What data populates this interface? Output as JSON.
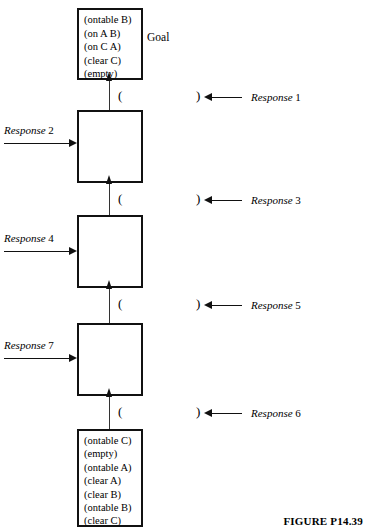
{
  "figure": {
    "caption": "FIGURE P14.39",
    "goal_annotation": "Goal",
    "paren_open": "(",
    "paren_close": ")"
  },
  "states": {
    "goal": {
      "name": "goal-state",
      "predicates": [
        "(ontable B)",
        "(on A B)",
        "(on C A)",
        "(clear C)",
        "(empty)"
      ]
    },
    "intermediate_1": {
      "name": "blank-state-1",
      "predicates": []
    },
    "intermediate_2": {
      "name": "blank-state-2",
      "predicates": []
    },
    "intermediate_3": {
      "name": "blank-state-3",
      "predicates": []
    },
    "initial": {
      "name": "initial-state",
      "predicates": [
        "(ontable C)",
        "(empty)",
        "(ontable A)",
        "(clear A)",
        "(clear B)",
        "(ontable B)",
        "(clear C)"
      ]
    }
  },
  "responses": {
    "right": [
      {
        "word": "Response",
        "number": "1"
      },
      {
        "word": "Response",
        "number": "3"
      },
      {
        "word": "Response",
        "number": "5"
      },
      {
        "word": "Response",
        "number": "6"
      }
    ],
    "left": [
      {
        "word": "Response",
        "number": "2"
      },
      {
        "word": "Response",
        "number": "4"
      },
      {
        "word": "Response",
        "number": "7"
      }
    ]
  }
}
